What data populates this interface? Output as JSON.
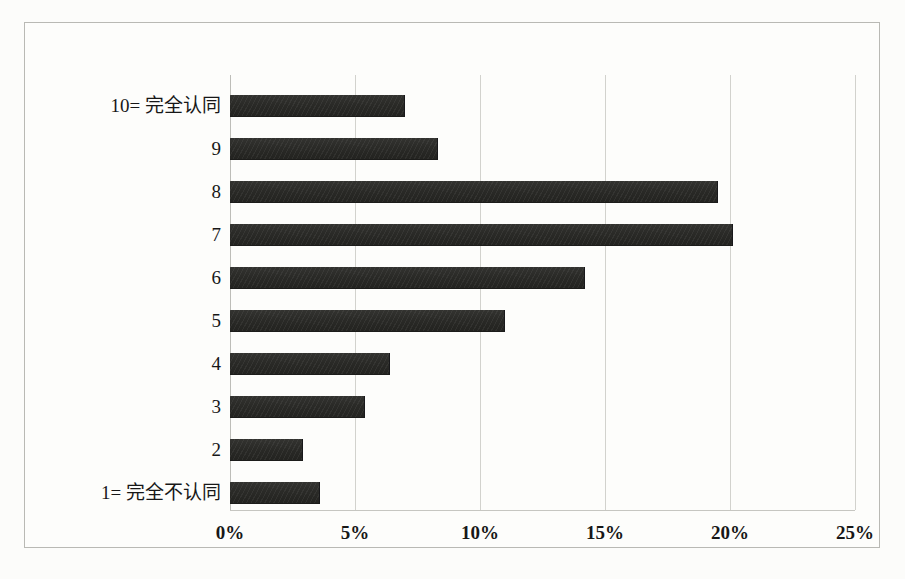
{
  "chart_data": {
    "type": "bar",
    "orientation": "horizontal",
    "title": "",
    "subtitle": "",
    "xlabel": "",
    "ylabel": "",
    "categories": [
      "10= 完全认同",
      "9",
      "8",
      "7",
      "6",
      "5",
      "4",
      "3",
      "2",
      "1= 完全不认同"
    ],
    "values": [
      7.0,
      8.3,
      19.5,
      20.1,
      14.2,
      11.0,
      6.4,
      5.4,
      2.9,
      3.6
    ],
    "value_format": "percent",
    "xlim": [
      0,
      25
    ],
    "xticks": [
      0,
      5,
      10,
      15,
      20,
      25
    ],
    "xtick_labels": [
      "0%",
      "5%",
      "10%",
      "15%",
      "20%",
      "25%"
    ],
    "grid": "vertical",
    "legend": "none",
    "data_labels": false,
    "series": [
      {
        "name": "",
        "values": [
          7.0,
          8.3,
          19.5,
          20.1,
          14.2,
          11.0,
          6.4,
          5.4,
          2.9,
          3.6
        ]
      }
    ]
  },
  "style": {
    "bar_color": "#2a2a27",
    "gridline_color": "#d2d2cd",
    "frame_color": "#b9b9b4",
    "background_color": "#fcfcfa",
    "text_color": "#171717"
  }
}
